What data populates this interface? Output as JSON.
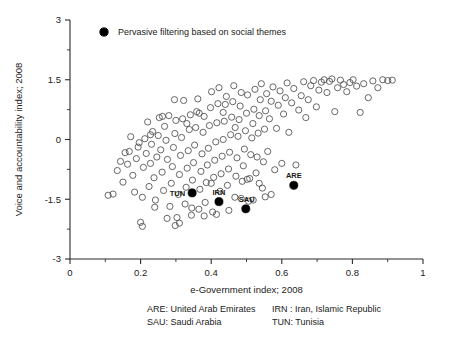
{
  "chart_data": {
    "type": "scatter",
    "title": "",
    "xlabel": "e-Government index; 2008",
    "ylabel": "Voice and accountability index; 2008",
    "xlim": [
      0,
      1
    ],
    "ylim": [
      -3,
      3
    ],
    "xticks": [
      "0",
      "0.2",
      "0.4",
      "0.6",
      "0.8",
      "1"
    ],
    "xtick_values": [
      0,
      0.2,
      0.4,
      0.6,
      0.8,
      1
    ],
    "yticks": [
      "3",
      "1.5",
      "0",
      "-1.5",
      "-3"
    ],
    "ytick_values": [
      3,
      1.5,
      0,
      -1.5,
      -3
    ],
    "minor_xticks": [
      0.1,
      0.3,
      0.5,
      0.7,
      0.9
    ],
    "minor_yticks": [
      2.25,
      0.75,
      -0.75,
      -2.25
    ],
    "grid": false,
    "legend_position": "top-left-inside",
    "legend": [
      {
        "label": "Pervasive filtering based on social themes",
        "marker": "filled-circle",
        "color": "#000000"
      }
    ],
    "series": [
      {
        "name": "countries",
        "marker": "open-circle",
        "color": "#4d4d4d",
        "points": [
          [
            0.108,
            -1.4
          ],
          [
            0.122,
            -1.37
          ],
          [
            0.134,
            -0.78
          ],
          [
            0.143,
            -0.55
          ],
          [
            0.15,
            -1.07
          ],
          [
            0.156,
            -0.33
          ],
          [
            0.163,
            -0.62
          ],
          [
            0.168,
            -0.3
          ],
          [
            0.172,
            0.07
          ],
          [
            0.178,
            -0.9
          ],
          [
            0.183,
            -1.32
          ],
          [
            0.188,
            -0.48
          ],
          [
            0.193,
            -0.19
          ],
          [
            0.196,
            -0.08
          ],
          [
            0.2,
            -2.08
          ],
          [
            0.205,
            -1.45
          ],
          [
            0.208,
            -0.7
          ],
          [
            0.212,
            0.02
          ],
          [
            0.216,
            -0.35
          ],
          [
            0.22,
            0.44
          ],
          [
            0.224,
            -1.18
          ],
          [
            0.228,
            -0.6
          ],
          [
            0.231,
            -0.12
          ],
          [
            0.234,
            0.2
          ],
          [
            0.238,
            -0.96
          ],
          [
            0.242,
            -1.52
          ],
          [
            0.246,
            -0.44
          ],
          [
            0.25,
            0.1
          ],
          [
            0.253,
            0.55
          ],
          [
            0.257,
            -0.26
          ],
          [
            0.261,
            -0.82
          ],
          [
            0.265,
            -1.28
          ],
          [
            0.268,
            0.33
          ],
          [
            0.272,
            -0.02
          ],
          [
            0.276,
            -0.5
          ],
          [
            0.28,
            0.6
          ],
          [
            0.283,
            -1.68
          ],
          [
            0.287,
            -1.1
          ],
          [
            0.29,
            -0.68
          ],
          [
            0.293,
            -0.2
          ],
          [
            0.297,
            0.15
          ],
          [
            0.3,
            0.48
          ],
          [
            0.303,
            -1.96
          ],
          [
            0.307,
            -1.38
          ],
          [
            0.31,
            -0.88
          ],
          [
            0.313,
            -0.4
          ],
          [
            0.316,
            0.05
          ],
          [
            0.319,
            0.52
          ],
          [
            0.322,
            0.98
          ],
          [
            0.326,
            -1.62
          ],
          [
            0.329,
            -1.2
          ],
          [
            0.332,
            -0.72
          ],
          [
            0.335,
            -0.28
          ],
          [
            0.338,
            0.25
          ],
          [
            0.341,
            0.62
          ],
          [
            0.344,
            -1.9
          ],
          [
            0.347,
            -1.02
          ],
          [
            0.35,
            -0.58
          ],
          [
            0.353,
            -0.14
          ],
          [
            0.356,
            0.3
          ],
          [
            0.359,
            0.7
          ],
          [
            0.362,
            1.02
          ],
          [
            0.365,
            -1.75
          ],
          [
            0.368,
            -1.25
          ],
          [
            0.371,
            -0.8
          ],
          [
            0.374,
            -0.36
          ],
          [
            0.377,
            0.18
          ],
          [
            0.38,
            0.58
          ],
          [
            0.383,
            -1.58
          ],
          [
            0.386,
            -1.08
          ],
          [
            0.389,
            -0.64
          ],
          [
            0.392,
            -0.22
          ],
          [
            0.395,
            0.35
          ],
          [
            0.398,
            0.8
          ],
          [
            0.401,
            1.2
          ],
          [
            0.404,
            -1.82
          ],
          [
            0.407,
            -0.95
          ],
          [
            0.41,
            -0.52
          ],
          [
            0.413,
            -0.06
          ],
          [
            0.416,
            0.42
          ],
          [
            0.419,
            0.9
          ],
          [
            0.422,
            1.3
          ],
          [
            0.425,
            -1.3
          ],
          [
            0.428,
            -0.86
          ],
          [
            0.431,
            -0.42
          ],
          [
            0.434,
            0.0
          ],
          [
            0.437,
            0.46
          ],
          [
            0.44,
            0.88
          ],
          [
            0.443,
            1.08
          ],
          [
            0.446,
            -1.15
          ],
          [
            0.449,
            -0.74
          ],
          [
            0.452,
            -0.32
          ],
          [
            0.455,
            0.12
          ],
          [
            0.458,
            0.56
          ],
          [
            0.461,
            0.95
          ],
          [
            0.464,
            1.35
          ],
          [
            0.467,
            -1.45
          ],
          [
            0.47,
            -0.92
          ],
          [
            0.473,
            -0.46
          ],
          [
            0.476,
            0.08
          ],
          [
            0.479,
            0.5
          ],
          [
            0.482,
            0.84
          ],
          [
            0.485,
            1.18
          ],
          [
            0.488,
            -1.05
          ],
          [
            0.491,
            -0.66
          ],
          [
            0.494,
            -0.24
          ],
          [
            0.497,
            0.22
          ],
          [
            0.5,
            0.66
          ],
          [
            0.503,
            1.12
          ],
          [
            0.506,
            -1.55
          ],
          [
            0.509,
            -0.98
          ],
          [
            0.512,
            -0.38
          ],
          [
            0.515,
            0.04
          ],
          [
            0.518,
            0.4
          ],
          [
            0.521,
            0.76
          ],
          [
            0.524,
            1.26
          ],
          [
            0.527,
            -0.84
          ],
          [
            0.53,
            -0.44
          ],
          [
            0.533,
            0.16
          ],
          [
            0.536,
            0.6
          ],
          [
            0.539,
            1.0
          ],
          [
            0.542,
            1.4
          ],
          [
            0.545,
            -1.22
          ],
          [
            0.548,
            -0.56
          ],
          [
            0.551,
            0.26
          ],
          [
            0.554,
            0.72
          ],
          [
            0.557,
            1.15
          ],
          [
            0.56,
            -0.3
          ],
          [
            0.565,
            0.52
          ],
          [
            0.57,
            0.96
          ],
          [
            0.575,
            1.32
          ],
          [
            0.58,
            -0.76
          ],
          [
            0.585,
            0.28
          ],
          [
            0.59,
            0.86
          ],
          [
            0.595,
            1.22
          ],
          [
            0.6,
            -0.6
          ],
          [
            0.605,
            0.64
          ],
          [
            0.61,
            1.05
          ],
          [
            0.615,
            1.42
          ],
          [
            0.62,
            0.18
          ],
          [
            0.628,
            0.92
          ],
          [
            0.634,
            1.28
          ],
          [
            0.64,
            -0.64
          ],
          [
            0.648,
            0.74
          ],
          [
            0.655,
            1.1
          ],
          [
            0.662,
            1.45
          ],
          [
            0.668,
            0.55
          ],
          [
            0.675,
            1.0
          ],
          [
            0.682,
            1.35
          ],
          [
            0.69,
            1.48
          ],
          [
            0.698,
            0.82
          ],
          [
            0.705,
            1.24
          ],
          [
            0.712,
            1.44
          ],
          [
            0.72,
            1.5
          ],
          [
            0.728,
            1.18
          ],
          [
            0.735,
            1.46
          ],
          [
            0.742,
            1.52
          ],
          [
            0.75,
            0.7
          ],
          [
            0.758,
            1.3
          ],
          [
            0.766,
            1.49
          ],
          [
            0.775,
            1.38
          ],
          [
            0.784,
            1.2
          ],
          [
            0.793,
            1.43
          ],
          [
            0.802,
            1.5
          ],
          [
            0.812,
            1.34
          ],
          [
            0.822,
            0.68
          ],
          [
            0.832,
            1.4
          ],
          [
            0.845,
            1.05
          ],
          [
            0.858,
            1.47
          ],
          [
            0.872,
            1.3
          ],
          [
            0.886,
            1.5
          ],
          [
            0.9,
            1.48
          ],
          [
            0.913,
            1.49
          ],
          [
            0.228,
            0.12
          ],
          [
            0.262,
            0.58
          ],
          [
            0.296,
            1.0
          ],
          [
            0.331,
            0.4
          ],
          [
            0.366,
            0.66
          ],
          [
            0.4,
            -1.1
          ],
          [
            0.434,
            0.68
          ],
          [
            0.468,
            0.3
          ],
          [
            0.502,
            -1.0
          ],
          [
            0.536,
            -1.1
          ],
          [
            0.57,
            -1.38
          ],
          [
            0.24,
            -1.7
          ],
          [
            0.275,
            -1.98
          ],
          [
            0.31,
            -2.1
          ],
          [
            0.345,
            -1.72
          ],
          [
            0.38,
            -1.92
          ],
          [
            0.415,
            -1.88
          ],
          [
            0.45,
            -1.78
          ],
          [
            0.485,
            -1.48
          ],
          [
            0.519,
            -1.52
          ],
          [
            0.553,
            -1.44
          ],
          [
            0.205,
            -2.18
          ],
          [
            0.298,
            -2.16
          ]
        ]
      },
      {
        "name": "Pervasive filtering based on social themes",
        "marker": "filled-circle",
        "color": "#000000",
        "points": [
          {
            "code": "TUN",
            "x": 0.346,
            "y": -1.34,
            "label_pos": "left"
          },
          {
            "code": "IRN",
            "x": 0.422,
            "y": -1.56,
            "label_pos": "top"
          },
          {
            "code": "SAU",
            "x": 0.498,
            "y": -1.74,
            "label_pos": "top-left"
          },
          {
            "code": "ARE",
            "x": 0.634,
            "y": -1.15,
            "label_pos": "top"
          }
        ]
      }
    ],
    "annotations": [
      {
        "text": "TUN"
      },
      {
        "text": "IRN"
      },
      {
        "text": "SAU"
      },
      {
        "text": "ARE"
      }
    ]
  },
  "footnote": {
    "col1": [
      "ARE: United Arab Emirates",
      "SAU: Saudi Arabia"
    ],
    "col2": [
      "IRN : Iran, Islamic Republic",
      "TUN: Tunisia"
    ]
  }
}
